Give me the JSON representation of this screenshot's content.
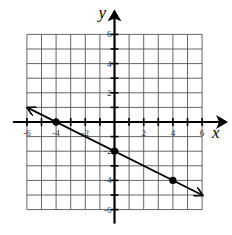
{
  "chart_data": {
    "type": "line",
    "title": "",
    "xlabel": "x",
    "ylabel": "y",
    "xlim": [
      -6,
      6
    ],
    "ylim": [
      -6,
      6
    ],
    "grid": true,
    "grid_step": 1,
    "x_ticks": [
      -6,
      -4,
      -2,
      2,
      4,
      6
    ],
    "y_ticks": [
      6,
      4,
      2,
      -2,
      -4,
      -6
    ],
    "x_tick_labels": [
      "-6",
      "-4",
      "-2",
      "2",
      "4",
      "6"
    ],
    "y_tick_labels": [
      "6",
      "4",
      "2",
      "-2",
      "-4",
      "-6"
    ],
    "series": [
      {
        "name": "line",
        "equation": "y = -1/2 x - 2",
        "slope": -0.5,
        "intercept": -2,
        "x_range": [
          -6,
          6
        ],
        "arrows_both_ends": true,
        "points": [
          {
            "x": -4,
            "y": 0
          },
          {
            "x": 0,
            "y": -2
          },
          {
            "x": 4,
            "y": -4
          }
        ]
      }
    ]
  }
}
